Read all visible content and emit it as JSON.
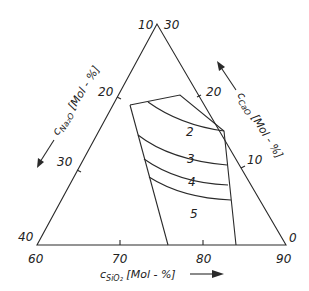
{
  "diagram": {
    "type": "ternary",
    "title": "",
    "colors": {
      "ink": "#2a2a2a",
      "background": "#ffffff"
    },
    "corners": {
      "top": {
        "na2o": 10,
        "cao": 30
      },
      "bottom_left": {
        "na2o": 40,
        "sio2": 60
      },
      "bottom_right": {
        "cao": 0,
        "sio2": 90
      }
    },
    "corner_labels": {
      "top_left": "10",
      "top_right": "30",
      "bottom_left_side": "40",
      "bottom_left_base": "60",
      "bottom_right_side": "0",
      "bottom_right_base": "90"
    },
    "axes": {
      "left": {
        "label_main": "c",
        "label_sub": "Na₂O",
        "label_unit": " [Mol - %]",
        "ticks": [
          "20",
          "30"
        ],
        "direction": "down-left"
      },
      "right": {
        "label_main": "c",
        "label_sub": "CaO",
        "label_unit": " [Mol - %]",
        "ticks": [
          "20",
          "10"
        ],
        "direction": "up-left"
      },
      "bottom": {
        "label_main": "c",
        "label_sub": "SiO₂",
        "label_unit": " [Mol - %]",
        "ticks": [
          "70",
          "80"
        ],
        "direction": "right"
      }
    },
    "regions": [
      {
        "label": "2"
      },
      {
        "label": "3"
      },
      {
        "label": "4"
      },
      {
        "label": "5"
      }
    ]
  }
}
